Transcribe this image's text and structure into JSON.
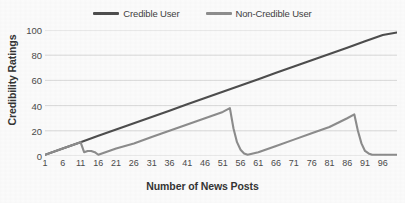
{
  "chart_data": {
    "type": "line",
    "title": "",
    "xlabel": "Number of News Posts",
    "ylabel": "Credibility Ratings",
    "xlim": [
      1,
      100
    ],
    "ylim": [
      0,
      100
    ],
    "grid": "horizontal",
    "legend_position": "top-center",
    "y_ticks": [
      0,
      20,
      40,
      60,
      80,
      100
    ],
    "x_ticks": [
      1,
      6,
      11,
      16,
      21,
      26,
      31,
      36,
      41,
      46,
      51,
      56,
      61,
      66,
      71,
      76,
      81,
      86,
      91,
      96
    ],
    "series": [
      {
        "name": "Credible User",
        "color": "#4d4d4d",
        "points": [
          [
            1,
            1
          ],
          [
            6,
            6
          ],
          [
            11,
            11
          ],
          [
            16,
            16
          ],
          [
            21,
            21
          ],
          [
            26,
            26
          ],
          [
            31,
            31
          ],
          [
            36,
            36
          ],
          [
            41,
            41
          ],
          [
            46,
            46
          ],
          [
            51,
            51
          ],
          [
            56,
            56
          ],
          [
            61,
            61
          ],
          [
            66,
            66
          ],
          [
            71,
            71
          ],
          [
            76,
            76
          ],
          [
            81,
            81
          ],
          [
            86,
            86
          ],
          [
            91,
            91
          ],
          [
            96,
            96
          ],
          [
            100,
            98
          ]
        ]
      },
      {
        "name": "Non-Credible User",
        "color": "#8c8c8c",
        "points": [
          [
            1,
            1
          ],
          [
            5,
            5
          ],
          [
            9,
            9
          ],
          [
            11,
            11
          ],
          [
            12,
            3
          ],
          [
            13,
            4
          ],
          [
            14,
            4
          ],
          [
            15,
            3
          ],
          [
            16,
            1
          ],
          [
            21,
            6
          ],
          [
            26,
            10
          ],
          [
            31,
            15
          ],
          [
            36,
            20
          ],
          [
            41,
            25
          ],
          [
            46,
            30
          ],
          [
            51,
            35
          ],
          [
            53,
            38
          ],
          [
            54,
            22
          ],
          [
            55,
            11
          ],
          [
            56,
            5
          ],
          [
            57,
            2
          ],
          [
            58,
            1
          ],
          [
            61,
            3
          ],
          [
            66,
            8
          ],
          [
            71,
            13
          ],
          [
            76,
            18
          ],
          [
            81,
            23
          ],
          [
            86,
            30
          ],
          [
            88,
            33
          ],
          [
            89,
            20
          ],
          [
            90,
            10
          ],
          [
            91,
            4
          ],
          [
            92,
            2
          ],
          [
            93,
            1
          ],
          [
            96,
            1
          ],
          [
            100,
            1
          ]
        ]
      }
    ]
  },
  "legend": {
    "entries": [
      {
        "label": "Credible User",
        "color": "#4d4d4d"
      },
      {
        "label": "Non-Credible User",
        "color": "#8c8c8c"
      }
    ]
  },
  "axes": {
    "y_title": "Credibility Ratings",
    "x_title": "Number of News Posts"
  },
  "style": {
    "background": "#fbfbfb",
    "gridline_color": "#d9d9d9",
    "tick_label_color": "#4a4a4a"
  }
}
